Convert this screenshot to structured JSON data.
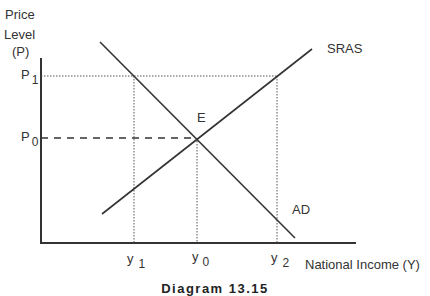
{
  "diagram": {
    "caption": "Diagram 13.15",
    "y_axis_label": [
      "Price",
      "Level",
      "(P)"
    ],
    "x_axis_label": "National Income (Y)",
    "price_labels": {
      "p1": {
        "main": "P",
        "sub": "1"
      },
      "p0": {
        "main": "P",
        "sub": "0"
      }
    },
    "income_labels": {
      "y1": {
        "main": "y",
        "sub": "1"
      },
      "y0": {
        "main": "y",
        "sub": "0"
      },
      "y2": {
        "main": "y",
        "sub": "2"
      }
    },
    "curves": {
      "sras": "SRAS",
      "ad": "AD"
    },
    "equilibrium_label": "E",
    "colors": {
      "line": "#333333",
      "guide": "#555555"
    }
  }
}
